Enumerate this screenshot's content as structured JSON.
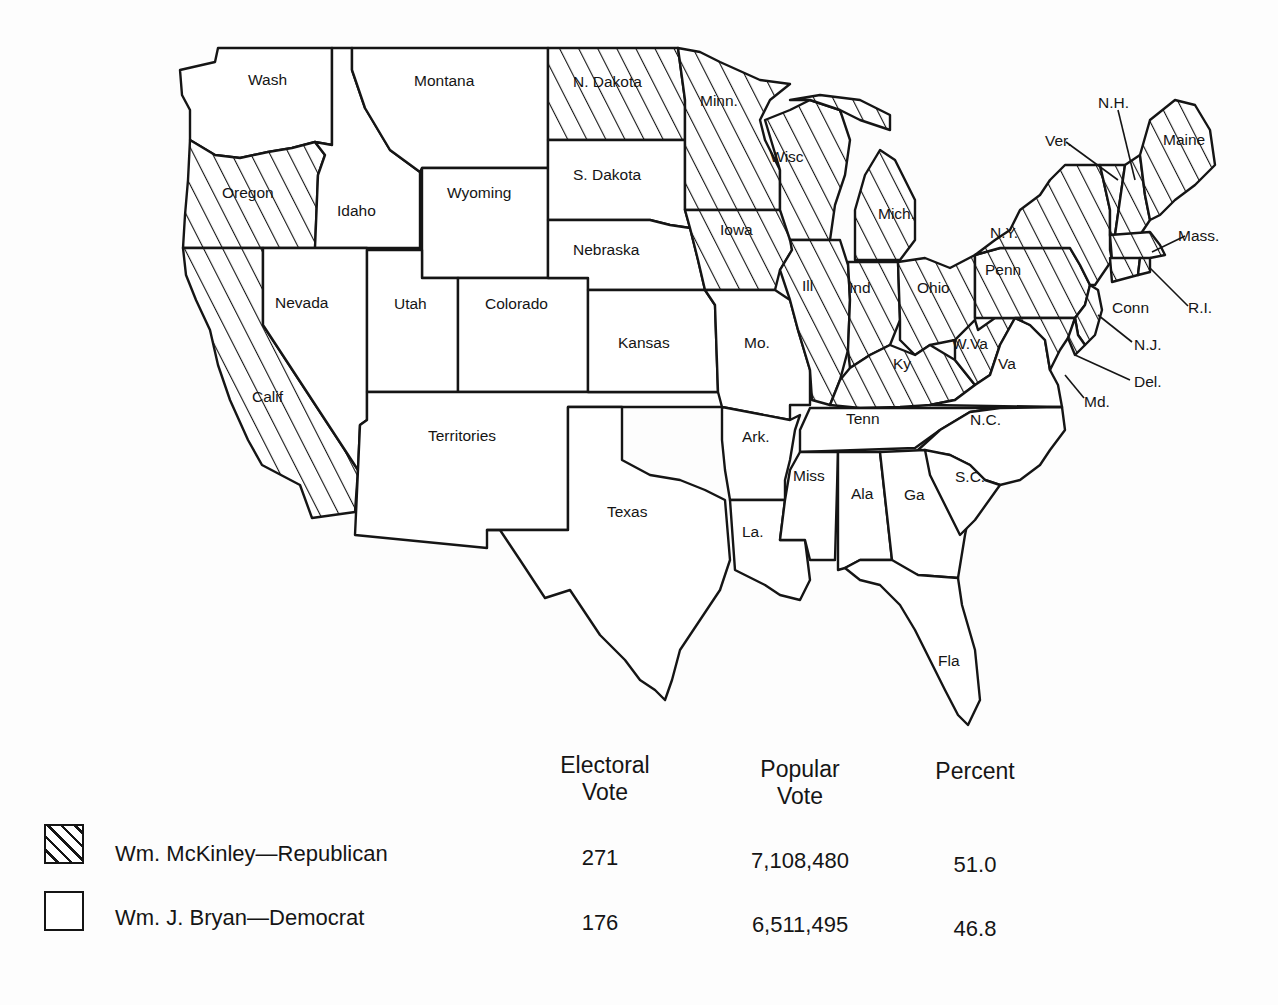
{
  "map": {
    "title": "Election of 1896",
    "pattern": {
      "republican": "diagonal-hatch",
      "democrat": "blank"
    },
    "colors": {
      "ink": "#151515",
      "paper": "#fdfdfd"
    },
    "states": [
      {
        "id": "wa",
        "label": "Wash",
        "party": "democrat"
      },
      {
        "id": "or",
        "label": "Oregon",
        "party": "republican"
      },
      {
        "id": "ca",
        "label": "Calif",
        "party": "republican"
      },
      {
        "id": "id",
        "label": "Idaho",
        "party": "democrat"
      },
      {
        "id": "nv",
        "label": "Nevada",
        "party": "democrat"
      },
      {
        "id": "mt",
        "label": "Montana",
        "party": "democrat"
      },
      {
        "id": "wy",
        "label": "Wyoming",
        "party": "democrat"
      },
      {
        "id": "ut",
        "label": "Utah",
        "party": "democrat"
      },
      {
        "id": "co",
        "label": "Colorado",
        "party": "democrat"
      },
      {
        "id": "terr",
        "label": "Territories",
        "party": "none"
      },
      {
        "id": "nd",
        "label": "N. Dakota",
        "party": "republican"
      },
      {
        "id": "sd",
        "label": "S. Dakota",
        "party": "democrat"
      },
      {
        "id": "ne",
        "label": "Nebraska",
        "party": "democrat"
      },
      {
        "id": "ks",
        "label": "Kansas",
        "party": "democrat"
      },
      {
        "id": "tx",
        "label": "Texas",
        "party": "democrat"
      },
      {
        "id": "mn",
        "label": "Minn.",
        "party": "republican"
      },
      {
        "id": "ia",
        "label": "Iowa",
        "party": "republican"
      },
      {
        "id": "mo",
        "label": "Mo.",
        "party": "democrat"
      },
      {
        "id": "ar",
        "label": "Ark.",
        "party": "democrat"
      },
      {
        "id": "la",
        "label": "La.",
        "party": "democrat"
      },
      {
        "id": "wi",
        "label": "Wisc",
        "party": "republican"
      },
      {
        "id": "il",
        "label": "Ill",
        "party": "republican"
      },
      {
        "id": "mi",
        "label": "Mich.",
        "party": "republican"
      },
      {
        "id": "in",
        "label": "Ind",
        "party": "republican"
      },
      {
        "id": "oh",
        "label": "Ohio",
        "party": "republican"
      },
      {
        "id": "ky",
        "label": "Ky",
        "party": "republican"
      },
      {
        "id": "tn",
        "label": "Tenn",
        "party": "democrat"
      },
      {
        "id": "ms",
        "label": "Miss",
        "party": "democrat"
      },
      {
        "id": "al",
        "label": "Ala",
        "party": "democrat"
      },
      {
        "id": "ga",
        "label": "Ga",
        "party": "democrat"
      },
      {
        "id": "fl",
        "label": "Fla",
        "party": "democrat"
      },
      {
        "id": "sc",
        "label": "S.C.",
        "party": "democrat"
      },
      {
        "id": "nc",
        "label": "N.C.",
        "party": "democrat"
      },
      {
        "id": "va",
        "label": "Va",
        "party": "democrat"
      },
      {
        "id": "wv",
        "label": "W.Va",
        "party": "republican"
      },
      {
        "id": "pa",
        "label": "Penn",
        "party": "republican"
      },
      {
        "id": "ny",
        "label": "N.Y.",
        "party": "republican"
      },
      {
        "id": "vt",
        "label": "Ver.",
        "party": "republican"
      },
      {
        "id": "nh",
        "label": "N.H.",
        "party": "republican"
      },
      {
        "id": "me",
        "label": "Maine",
        "party": "republican"
      },
      {
        "id": "ma",
        "label": "Mass.",
        "party": "republican"
      },
      {
        "id": "ri",
        "label": "R.I.",
        "party": "republican"
      },
      {
        "id": "ct",
        "label": "Conn",
        "party": "republican"
      },
      {
        "id": "nj",
        "label": "N.J.",
        "party": "republican"
      },
      {
        "id": "de",
        "label": "Del.",
        "party": "republican"
      },
      {
        "id": "md",
        "label": "Md.",
        "party": "republican"
      }
    ]
  },
  "legend": {
    "headers": {
      "electoral": [
        "Electoral",
        "Vote"
      ],
      "popular": [
        "Popular",
        "Vote"
      ],
      "percent": "Percent"
    },
    "rows": [
      {
        "swatch": "hatched",
        "candidate": "Wm. McKinley—Republican",
        "electoral": "271",
        "popular": "7,108,480",
        "percent": "51.0"
      },
      {
        "swatch": "blank",
        "candidate": "Wm. J. Bryan—Democrat",
        "electoral": "176",
        "popular": "6,511,495",
        "percent": "46.8"
      }
    ]
  }
}
